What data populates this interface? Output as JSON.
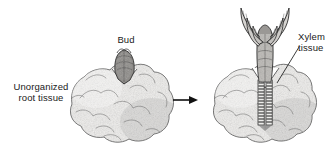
{
  "figure": {
    "background_color": "#ffffff",
    "ink_color": "#333333",
    "style": "pen-and-ink stipple botanical illustration"
  },
  "labels": {
    "bud": "Bud",
    "unorganized_root_tissue": "Unorganized\nroot tissue",
    "xylem_tissue": "Xylem\ntissue"
  },
  "panels": [
    {
      "id": "left",
      "name": "callus-with-bud",
      "structures": [
        "unorganized root tissue callus",
        "bud"
      ]
    },
    {
      "id": "right",
      "name": "callus-with-shoot",
      "structures": [
        "unorganized root tissue callus",
        "leafy shoot",
        "xylem tissue strand"
      ]
    }
  ],
  "arrow": {
    "direction": "right",
    "label": ""
  }
}
